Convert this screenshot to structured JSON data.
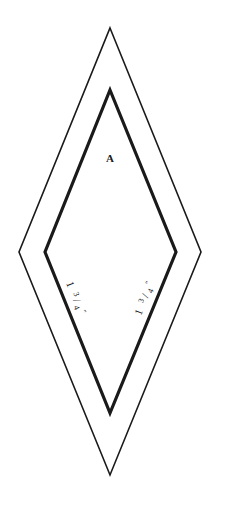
{
  "diagram": {
    "type": "quilt-template",
    "shape": "diamond",
    "piece_label": "A",
    "colors": {
      "background": "#ffffff",
      "outer_line": "#1a1a1a",
      "inner_line": "#1a1a1a"
    },
    "outer_diamond": {
      "description": "seam allowance / cutting line",
      "points": {
        "top": [
          110,
          28
        ],
        "right": [
          201,
          252
        ],
        "bottom": [
          110,
          475
        ],
        "left": [
          19,
          252
        ]
      },
      "stroke_width": 1.6
    },
    "inner_diamond": {
      "description": "sewing line",
      "points": {
        "top": [
          110,
          90
        ],
        "right": [
          176,
          252
        ],
        "bottom": [
          110,
          413
        ],
        "left": [
          45,
          252
        ]
      },
      "stroke_width": 3.2
    },
    "dimensions": [
      {
        "id": "lower-left-edge",
        "whole": "1",
        "numerator": "3",
        "denominator": "4",
        "unit": "\""
      },
      {
        "id": "lower-right-edge",
        "whole": "1",
        "numerator": "3",
        "denominator": "4",
        "unit": "\""
      }
    ]
  }
}
